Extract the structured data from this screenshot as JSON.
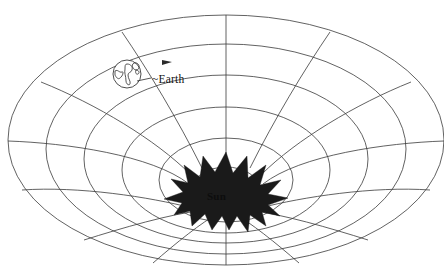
{
  "figure": {
    "background_color": "#ffffff",
    "line_color": "#3a3a3a",
    "sun_color": "#1a1a1a"
  },
  "labels": {
    "earth": "~Earth",
    "sun": "Sun"
  },
  "objects": {
    "earth": {
      "name": "Earth",
      "center_x": 127,
      "center_y": 74,
      "radius": 14
    },
    "sun": {
      "name": "Sun",
      "center_x": 226,
      "center_y": 191,
      "radius": 36,
      "spikes": 16
    },
    "orbit_arrow": {
      "name": "orbit-direction-arrow",
      "x": 166,
      "y": 61
    }
  },
  "grid": {
    "type": "funnel",
    "center_x": 226,
    "center_y": 196,
    "rings": 6,
    "spokes": 12,
    "ring_radii_x": [
      218,
      182,
      146,
      110,
      72,
      38
    ],
    "ring_radii_y": [
      74,
      62,
      51,
      40,
      28,
      17
    ],
    "ring_center_y": [
      140,
      150,
      160,
      172,
      183,
      193
    ],
    "hidden_lower_spokes": true
  }
}
